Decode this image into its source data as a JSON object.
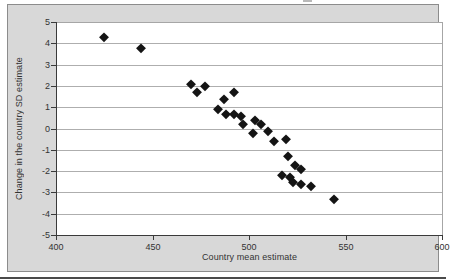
{
  "chart_data": {
    "type": "scatter",
    "title": "",
    "xlabel": "Country mean estimate",
    "ylabel": "Change in the country SD estimate",
    "xlim": [
      400,
      600
    ],
    "ylim": [
      -5,
      5
    ],
    "x_ticks": [
      "400",
      "450",
      "500",
      "550",
      "600"
    ],
    "y_ticks": [
      "5",
      "4",
      "3",
      "2",
      "1",
      "0",
      "-1",
      "-2",
      "-3",
      "-4",
      "-5"
    ],
    "grid": "horizontal-only",
    "legend": "none",
    "marker": "diamond",
    "colors": {
      "marker": "#141414",
      "chart_background": "#d8d8d8",
      "plot_background": "#ffffff",
      "gridline": "#aeaeae",
      "axis_line": "#3a3a3a",
      "tick_text": "#333333",
      "frame_border": "#8c8c8c"
    },
    "points": [
      {
        "x": 425,
        "y": 4.3
      },
      {
        "x": 444,
        "y": 3.8
      },
      {
        "x": 470,
        "y": 2.1
      },
      {
        "x": 477,
        "y": 2.0
      },
      {
        "x": 473,
        "y": 1.7
      },
      {
        "x": 492,
        "y": 1.7
      },
      {
        "x": 487,
        "y": 1.4
      },
      {
        "x": 484,
        "y": 0.9
      },
      {
        "x": 488,
        "y": 0.7
      },
      {
        "x": 492,
        "y": 0.7
      },
      {
        "x": 496,
        "y": 0.6
      },
      {
        "x": 503,
        "y": 0.4
      },
      {
        "x": 497,
        "y": 0.2
      },
      {
        "x": 506,
        "y": 0.2
      },
      {
        "x": 510,
        "y": -0.1
      },
      {
        "x": 502,
        "y": -0.2
      },
      {
        "x": 519,
        "y": -0.5
      },
      {
        "x": 513,
        "y": -0.6
      },
      {
        "x": 520,
        "y": -1.3
      },
      {
        "x": 524,
        "y": -1.7
      },
      {
        "x": 527,
        "y": -1.9
      },
      {
        "x": 517,
        "y": -2.2
      },
      {
        "x": 521,
        "y": -2.3
      },
      {
        "x": 523,
        "y": -2.5
      },
      {
        "x": 527,
        "y": -2.6
      },
      {
        "x": 532,
        "y": -2.7
      },
      {
        "x": 544,
        "y": -3.3
      }
    ]
  }
}
